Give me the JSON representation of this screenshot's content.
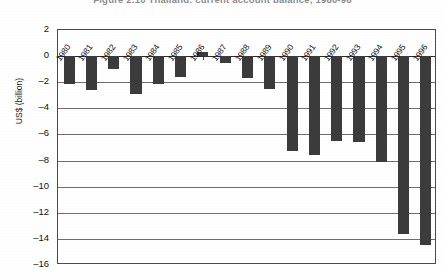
{
  "figure": {
    "title": "Figure 2.10   Thailand: current account balance, 1980-96",
    "title_visible": false
  },
  "chart_data": {
    "type": "bar",
    "title": "Figure 2.10   Thailand: current account balance, 1980-96",
    "xlabel": "",
    "ylabel": "US$ (billion)",
    "ylim": [
      -16,
      2
    ],
    "ytick_step": 2,
    "grid": true,
    "legend": false,
    "bar_color": "#3b3b3b",
    "categories": [
      "1980",
      "1981",
      "1982",
      "1983",
      "1984",
      "1985",
      "1986",
      "1987",
      "1988",
      "1989",
      "1990",
      "1991",
      "1992",
      "1993",
      "1994",
      "1995",
      "1996"
    ],
    "values": [
      -2.1,
      -2.6,
      -1.0,
      -2.9,
      -2.1,
      -1.6,
      0.3,
      -0.5,
      -1.7,
      -2.5,
      -7.3,
      -7.6,
      -6.5,
      -6.6,
      -8.1,
      -13.6,
      -14.5
    ],
    "yticks": [
      "2",
      "0",
      "-2",
      "-4",
      "-6",
      "-8",
      "-10",
      "-12",
      "-14",
      "-16"
    ]
  }
}
